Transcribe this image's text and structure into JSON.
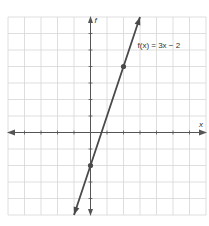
{
  "chart_data": {
    "type": "line",
    "title": "",
    "function_label": "f(x) = 3x − 2",
    "xlabel": "x",
    "ylabel": "f",
    "xlim": [
      -5,
      7
    ],
    "ylim": [
      -5,
      7
    ],
    "grid": true,
    "series": [
      {
        "name": "f(x) = 3x − 2",
        "slope": 3,
        "intercept": -2,
        "points": [
          {
            "x": 0,
            "y": -2
          },
          {
            "x": 2,
            "y": 4
          }
        ]
      }
    ],
    "colors": {
      "line": "#4a4a4a",
      "grid": "#d6d6d6",
      "axis": "#555555"
    }
  },
  "labels": {
    "x_axis": "x",
    "y_axis": "f",
    "equation": "f(x) = 3x − 2"
  }
}
